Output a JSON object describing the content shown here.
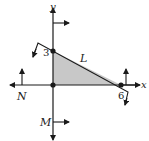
{
  "diagram": {
    "axes": {
      "x_label": "x",
      "y_label": "y"
    },
    "intercepts": {
      "y_intercept": "3",
      "x_intercept": "6"
    },
    "lines": {
      "L": "L",
      "N": "N",
      "M": "M"
    },
    "colors": {
      "ink": "#1a1a1a",
      "shade": "#c8c8c8",
      "background": "#ffffff"
    },
    "region": "triangle bounded by L, N (x-axis) and M (y-axis)"
  }
}
